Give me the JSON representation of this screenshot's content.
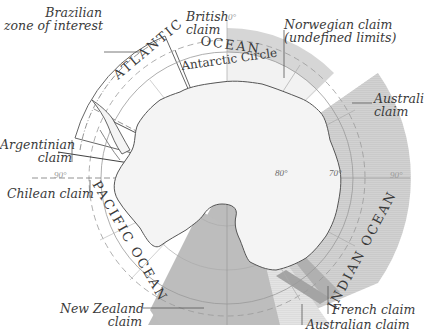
{
  "map": {
    "title": "Antarctic territorial claims",
    "pole": {
      "x": 227,
      "y": 178
    },
    "colors": {
      "claim_fill": "#c9c9c9",
      "claim_fill_light": "#dedede",
      "norwegian_band": "#d4d4d4",
      "french_claim": "#a9a9a9",
      "new_zealand": "#bdbdbd",
      "coastline": "#555555",
      "grid": "#a8a8a8",
      "background": "#ffffff"
    },
    "oceans": {
      "atlantic": "ATLANTIC",
      "atlantic_ocean": "OCEAN",
      "pacific": "PACIFIC OCEAN",
      "indian": "INDIAN OCEAN"
    },
    "antarctic_circle_label": "Antarctic Circle",
    "claims": [
      {
        "id": "brazilian",
        "line1": "Brazilian",
        "line2": "zone of interest"
      },
      {
        "id": "british",
        "line1": "British",
        "line2": "claim"
      },
      {
        "id": "norwegian",
        "line1": "Norwegian claim",
        "line2": "(undefined limits)"
      },
      {
        "id": "australian_east",
        "line1": "Australi",
        "line2": "claim"
      },
      {
        "id": "argentinian",
        "line1": "Argentinian",
        "line2": "claim"
      },
      {
        "id": "chilean",
        "line1": "Chilean claim"
      },
      {
        "id": "new_zealand",
        "line1": "New Zealand",
        "line2": "claim"
      },
      {
        "id": "french",
        "line1": "French claim"
      },
      {
        "id": "australian_south",
        "line1": "Australian claim"
      }
    ],
    "degree_labels": {
      "zero": "0°",
      "ninety_west": "90°",
      "ninety_east": "90°",
      "eighty": "80°",
      "seventy": "70°"
    }
  }
}
